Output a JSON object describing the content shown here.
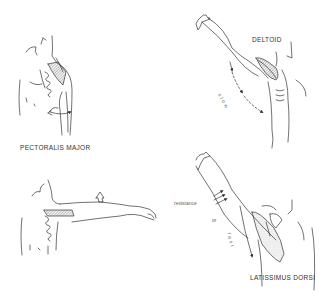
{
  "panels": [
    {
      "id": "pectoralis-major",
      "label": "PECTORALIS MAJOR",
      "position": "top-left",
      "muscle_highlight": "pectoralis major (hatched)",
      "annotation": "rotation arrow around upper arm"
    },
    {
      "id": "deltoid",
      "label": "DELTOID",
      "position": "top-right",
      "speed_text": "slow",
      "annotation": "arm raised overhead, dashed arrow downward"
    },
    {
      "id": "pectoralis-horizontal",
      "label": "",
      "position": "bottom-left",
      "annotation": "arm extended horizontally, upward arrow"
    },
    {
      "id": "latissimus-dorsi",
      "label": "LATISSIMUS DORSI",
      "position": "bottom-right",
      "resistance_text": "resistance",
      "or_text": "or",
      "speed_text": "fast",
      "annotation": "arm raised overhead, resistance arrows, curved arrow downward"
    }
  ],
  "colors": {
    "line": "#333333",
    "hatch": "#888888",
    "background": "#ffffff"
  }
}
